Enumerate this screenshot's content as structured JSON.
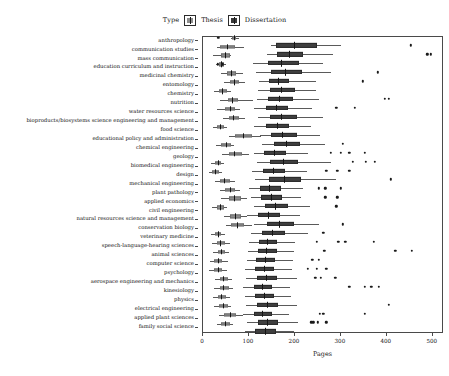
{
  "legend": {
    "title": "Type",
    "items": [
      {
        "label": "Thesis",
        "swatch": "thesis-swatch-icon",
        "color": "#8c8c8c"
      },
      {
        "label": "Dissertation",
        "swatch": "dissertation-swatch-icon",
        "color": "#3f3f3f"
      }
    ]
  },
  "chart_data": {
    "type": "bar",
    "subtype": "grouped-horizontal-boxplot",
    "title": "",
    "xlabel": "Pages",
    "ylabel": "",
    "xlim": [
      0,
      520
    ],
    "xticks": [
      0,
      100,
      200,
      300,
      400,
      500
    ],
    "grid": false,
    "legend_position": "top-center",
    "orientation": "horizontal",
    "group_names": [
      "Thesis",
      "Dissertation"
    ],
    "group_colors": [
      "#8c8c8c",
      "#3f3f3f"
    ],
    "categories": [
      "anthropology",
      "communication studies",
      "mass communication",
      "education curriculum and instruction",
      "medicinal chemistry",
      "entomology",
      "chemistry",
      "nutrition",
      "water resources science",
      "bioproducts/biosystems science engineering and management",
      "food science",
      "educational policy and administration",
      "chemical engineering",
      "geology",
      "biomedical engineering",
      "design",
      "mechanical engineering",
      "plant pathology",
      "applied economics",
      "civil engineering",
      "natural resources science and management",
      "conservation biology",
      "veterinary medicine",
      "speech-language-hearing sciences",
      "animal sciences",
      "computer science",
      "psychology",
      "aerospace engineering and mechanics",
      "kinesiology",
      "physics",
      "electrical engineering",
      "applied plant sciences",
      "family social science"
    ],
    "series": [
      {
        "name": "Thesis",
        "boxes": [
          {
            "min": 60,
            "q1": 63,
            "median": 68,
            "q3": 72,
            "max": 78,
            "outliers": [
              33
            ]
          },
          {
            "min": 30,
            "q1": 38,
            "median": 52,
            "q3": 70,
            "max": 90,
            "outliers": []
          },
          {
            "min": 22,
            "q1": 40,
            "median": 48,
            "q3": 58,
            "max": 62,
            "outliers": []
          },
          {
            "min": 28,
            "q1": 34,
            "median": 40,
            "q3": 46,
            "max": 50,
            "outliers": [
              32,
              42
            ]
          },
          {
            "min": 40,
            "q1": 52,
            "median": 62,
            "q3": 72,
            "max": 88,
            "outliers": []
          },
          {
            "min": 46,
            "q1": 58,
            "median": 68,
            "q3": 78,
            "max": 92,
            "outliers": []
          },
          {
            "min": 24,
            "q1": 34,
            "median": 42,
            "q3": 52,
            "max": 60,
            "outliers": []
          },
          {
            "min": 38,
            "q1": 54,
            "median": 64,
            "q3": 76,
            "max": 108,
            "outliers": []
          },
          {
            "min": 30,
            "q1": 48,
            "median": 58,
            "q3": 70,
            "max": 80,
            "outliers": []
          },
          {
            "min": 44,
            "q1": 56,
            "median": 66,
            "q3": 78,
            "max": 92,
            "outliers": []
          },
          {
            "min": 22,
            "q1": 30,
            "median": 38,
            "q3": 46,
            "max": 52,
            "outliers": []
          },
          {
            "min": 56,
            "q1": 70,
            "median": 86,
            "q3": 106,
            "max": 126,
            "outliers": []
          },
          {
            "min": 28,
            "q1": 40,
            "median": 50,
            "q3": 60,
            "max": 68,
            "outliers": []
          },
          {
            "min": 42,
            "q1": 56,
            "median": 68,
            "q3": 84,
            "max": 100,
            "outliers": []
          },
          {
            "min": 18,
            "q1": 26,
            "median": 32,
            "q3": 40,
            "max": 46,
            "outliers": []
          },
          {
            "min": 12,
            "q1": 20,
            "median": 26,
            "q3": 34,
            "max": 42,
            "outliers": []
          },
          {
            "min": 26,
            "q1": 36,
            "median": 46,
            "q3": 58,
            "max": 70,
            "outliers": []
          },
          {
            "min": 36,
            "q1": 48,
            "median": 58,
            "q3": 70,
            "max": 80,
            "outliers": []
          },
          {
            "min": 40,
            "q1": 56,
            "median": 68,
            "q3": 82,
            "max": 96,
            "outliers": []
          },
          {
            "min": 20,
            "q1": 30,
            "median": 36,
            "q3": 46,
            "max": 52,
            "outliers": []
          },
          {
            "min": 46,
            "q1": 58,
            "median": 70,
            "q3": 82,
            "max": 96,
            "outliers": []
          },
          {
            "min": 50,
            "q1": 62,
            "median": 74,
            "q3": 90,
            "max": 106,
            "outliers": []
          },
          {
            "min": 18,
            "q1": 26,
            "median": 32,
            "q3": 40,
            "max": 48,
            "outliers": []
          },
          {
            "min": 20,
            "q1": 30,
            "median": 38,
            "q3": 48,
            "max": 58,
            "outliers": []
          },
          {
            "min": 22,
            "q1": 32,
            "median": 40,
            "q3": 48,
            "max": 56,
            "outliers": []
          },
          {
            "min": 16,
            "q1": 24,
            "median": 32,
            "q3": 42,
            "max": 54,
            "outliers": []
          },
          {
            "min": 14,
            "q1": 24,
            "median": 32,
            "q3": 42,
            "max": 52,
            "outliers": []
          },
          {
            "min": 26,
            "q1": 36,
            "median": 44,
            "q3": 54,
            "max": 64,
            "outliers": []
          },
          {
            "min": 24,
            "q1": 36,
            "median": 44,
            "q3": 56,
            "max": 66,
            "outliers": []
          },
          {
            "min": 22,
            "q1": 32,
            "median": 40,
            "q3": 50,
            "max": 58,
            "outliers": []
          },
          {
            "min": 24,
            "q1": 34,
            "median": 44,
            "q3": 54,
            "max": 62,
            "outliers": []
          },
          {
            "min": 34,
            "q1": 46,
            "median": 58,
            "q3": 72,
            "max": 86,
            "outliers": []
          },
          {
            "min": 30,
            "q1": 40,
            "median": 48,
            "q3": 58,
            "max": 66,
            "outliers": []
          }
        ]
      },
      {
        "name": "Dissertation",
        "boxes": [
          {
            "min": 148,
            "q1": 158,
            "median": 198,
            "q3": 248,
            "max": 300,
            "outliers": [
              452
            ]
          },
          {
            "min": 140,
            "q1": 162,
            "median": 188,
            "q3": 218,
            "max": 282,
            "outliers": [
              488,
              496
            ]
          },
          {
            "min": 108,
            "q1": 142,
            "median": 170,
            "q3": 208,
            "max": 262,
            "outliers": []
          },
          {
            "min": 116,
            "q1": 148,
            "median": 178,
            "q3": 216,
            "max": 278,
            "outliers": [
              380
            ]
          },
          {
            "min": 122,
            "q1": 144,
            "median": 164,
            "q3": 188,
            "max": 246,
            "outliers": [
              348
            ]
          },
          {
            "min": 120,
            "q1": 146,
            "median": 170,
            "q3": 200,
            "max": 246,
            "outliers": []
          },
          {
            "min": 118,
            "q1": 142,
            "median": 166,
            "q3": 196,
            "max": 252,
            "outliers": [
              396,
              404
            ]
          },
          {
            "min": 112,
            "q1": 136,
            "median": 158,
            "q3": 186,
            "max": 238,
            "outliers": [
              290,
              330
            ]
          },
          {
            "min": 120,
            "q1": 146,
            "median": 170,
            "q3": 204,
            "max": 262,
            "outliers": []
          },
          {
            "min": 112,
            "q1": 138,
            "median": 160,
            "q3": 188,
            "max": 236,
            "outliers": []
          },
          {
            "min": 124,
            "q1": 148,
            "median": 172,
            "q3": 204,
            "max": 254,
            "outliers": []
          },
          {
            "min": 128,
            "q1": 154,
            "median": 180,
            "q3": 212,
            "max": 266,
            "outliers": [
              304
            ]
          },
          {
            "min": 110,
            "q1": 132,
            "median": 154,
            "q3": 180,
            "max": 228,
            "outliers": [
              278,
              300,
              318,
              352
            ]
          },
          {
            "min": 118,
            "q1": 146,
            "median": 174,
            "q3": 206,
            "max": 278,
            "outliers": [
              326,
              354,
              374
            ]
          },
          {
            "min": 106,
            "q1": 130,
            "median": 152,
            "q3": 178,
            "max": 226,
            "outliers": [
              268,
              292,
              318
            ]
          },
          {
            "min": 114,
            "q1": 144,
            "median": 176,
            "q3": 214,
            "max": 290,
            "outliers": [
              408
            ]
          },
          {
            "min": 100,
            "q1": 124,
            "median": 144,
            "q3": 170,
            "max": 218,
            "outliers": [
              252,
              266,
              300
            ]
          },
          {
            "min": 104,
            "q1": 126,
            "median": 148,
            "q3": 172,
            "max": 214,
            "outliers": [
              266,
              292
            ]
          },
          {
            "min": 110,
            "q1": 134,
            "median": 156,
            "q3": 184,
            "max": 232,
            "outliers": [
              290
            ]
          },
          {
            "min": 96,
            "q1": 120,
            "median": 142,
            "q3": 168,
            "max": 212,
            "outliers": []
          },
          {
            "min": 112,
            "q1": 140,
            "median": 166,
            "q3": 198,
            "max": 252,
            "outliers": [
              304
            ]
          },
          {
            "min": 104,
            "q1": 128,
            "median": 150,
            "q3": 178,
            "max": 228,
            "outliers": [
              262
            ]
          },
          {
            "min": 100,
            "q1": 122,
            "median": 140,
            "q3": 162,
            "max": 200,
            "outliers": [
              248,
              294,
              310,
              372
            ]
          },
          {
            "min": 98,
            "q1": 120,
            "median": 138,
            "q3": 160,
            "max": 198,
            "outliers": [
              264,
              418,
              454
            ]
          },
          {
            "min": 96,
            "q1": 116,
            "median": 134,
            "q3": 156,
            "max": 196,
            "outliers": [
              238,
              252
            ]
          },
          {
            "min": 92,
            "q1": 114,
            "median": 132,
            "q3": 154,
            "max": 194,
            "outliers": [
              228,
              248,
              268
            ]
          },
          {
            "min": 94,
            "q1": 118,
            "median": 138,
            "q3": 162,
            "max": 204,
            "outliers": [
              244,
              256,
              288
            ]
          },
          {
            "min": 88,
            "q1": 110,
            "median": 128,
            "q3": 150,
            "max": 190,
            "outliers": [
              318,
              352,
              366,
              382
            ]
          },
          {
            "min": 92,
            "q1": 114,
            "median": 132,
            "q3": 154,
            "max": 192,
            "outliers": []
          },
          {
            "min": 94,
            "q1": 118,
            "median": 140,
            "q3": 164,
            "max": 204,
            "outliers": [
              404
            ]
          },
          {
            "min": 88,
            "q1": 110,
            "median": 128,
            "q3": 150,
            "max": 188,
            "outliers": [
              254,
              262,
              352
            ]
          },
          {
            "min": 96,
            "q1": 120,
            "median": 140,
            "q3": 164,
            "max": 206,
            "outliers": [
              236,
              240,
              250,
              268
            ]
          },
          {
            "min": 92,
            "q1": 114,
            "median": 134,
            "q3": 158,
            "max": 198,
            "outliers": []
          }
        ]
      }
    ]
  }
}
